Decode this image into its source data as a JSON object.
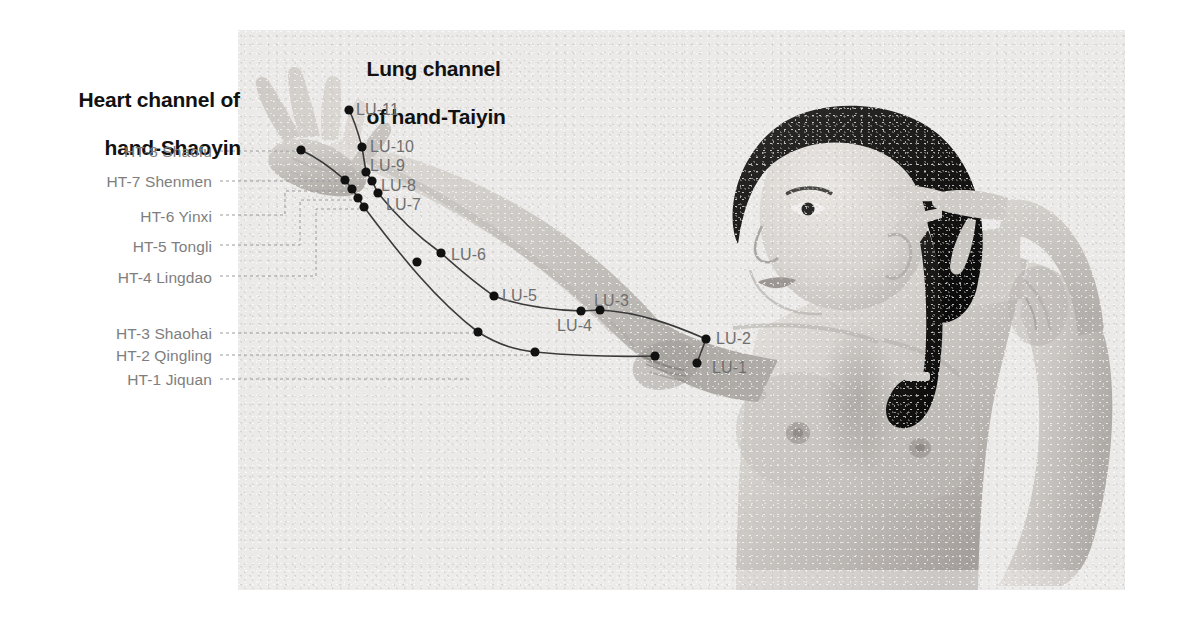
{
  "figure": {
    "kind": "anatomical-photo-diagram",
    "background_color": "#ffffff",
    "plate_color": "#eeeeee",
    "marker_color": "#111111",
    "channel_line_color": "#3a3a3a",
    "leader_line_color": "#9a9a9a",
    "heading_color": "#111111",
    "ht_label_color": "#7e7e7e",
    "lu_label_color": "#6f6f6f"
  },
  "headings": {
    "heart": {
      "line1": "Heart channel of",
      "line2": "hand-Shaoyin"
    },
    "lung": {
      "line1": "Lung channel",
      "line2": "of hand-Taiyin"
    }
  },
  "heart_channel": {
    "name": "Heart channel of hand-Shaoyin",
    "abbr": "HT",
    "points": [
      {
        "id": "HT-8",
        "label": "HT-8 Shaofu",
        "label_x": 212,
        "label_y": 143,
        "x": 301,
        "y": 150,
        "leader": "M 220 151 H 296"
      },
      {
        "id": "HT-7",
        "label": "HT-7 Shenmen",
        "label_x": 212,
        "label_y": 173,
        "x": 345,
        "y": 180,
        "leader": "M 220 181 H 340"
      },
      {
        "id": "HT-6",
        "label": "HT-6 Yinxi",
        "label_x": 212,
        "label_y": 208,
        "x": 352,
        "y": 189,
        "leader": "M 220 215 H 285 V 191 H 347"
      },
      {
        "id": "HT-5",
        "label": "HT-5 Tongli",
        "label_x": 212,
        "label_y": 238,
        "x": 358,
        "y": 198,
        "leader": "M 220 245 H 300 V 200 H 353"
      },
      {
        "id": "HT-4",
        "label": "HT-4 Lingdao",
        "label_x": 212,
        "label_y": 269,
        "x": 364,
        "y": 207,
        "leader": "M 220 276 H 316 V 209 H 359"
      },
      {
        "id": "HT-3",
        "label": "HT-3 Shaohai",
        "label_x": 212,
        "label_y": 325,
        "x": 478,
        "y": 332,
        "leader": "M 220 333 H 473"
      },
      {
        "id": "HT-2",
        "label": "HT-2 Qingling",
        "label_x": 212,
        "label_y": 347,
        "x": 535,
        "y": 352,
        "leader": "M 220 355 H 530"
      },
      {
        "id": "HT-1",
        "label": "HT-1 Jiquan",
        "label_x": 212,
        "label_y": 371,
        "x": 655,
        "y": 356,
        "leader": "M 220 379 H 470 V 379 H 470"
      }
    ],
    "path": "M 301 150 C 322 160 336 172 345 180 L 352 189 L 358 198 L 364 207 C 400 255 436 300 478 332 C 500 346 518 350 535 352 C 578 356 620 357 655 356"
  },
  "lung_channel": {
    "name": "Lung channel of hand-Taiyin",
    "abbr": "LU",
    "points": [
      {
        "id": "LU-11",
        "label": "LU-11",
        "label_x": 356,
        "label_y": 101,
        "x": 349,
        "y": 110
      },
      {
        "id": "LU-10",
        "label": "LU-10",
        "label_x": 370,
        "label_y": 138,
        "x": 362,
        "y": 147
      },
      {
        "id": "LU-9",
        "label": "LU-9",
        "label_x": 370,
        "label_y": 157,
        "x": 366,
        "y": 172
      },
      {
        "id": "LU-8",
        "label": "LU-8",
        "label_x": 381,
        "label_y": 177,
        "x": 372,
        "y": 181
      },
      {
        "id": "LU-7",
        "label": "LU-7",
        "label_x": 386,
        "label_y": 196,
        "x": 378,
        "y": 193
      },
      {
        "id": "LU-6",
        "label": "LU-6",
        "label_x": 451,
        "label_y": 246,
        "x": 441,
        "y": 253
      },
      {
        "id": "LU-5",
        "label": "LU-5",
        "label_x": 502,
        "label_y": 287,
        "x": 494,
        "y": 296
      },
      {
        "id": "LU-4",
        "label": "LU-4",
        "label_x": 557,
        "label_y": 317,
        "x": 581,
        "y": 311
      },
      {
        "id": "LU-3",
        "label": "LU-3",
        "label_x": 594,
        "label_y": 292,
        "x": 600,
        "y": 310
      },
      {
        "id": "LU-2",
        "label": "LU-2",
        "label_x": 716,
        "label_y": 330,
        "x": 706,
        "y": 339
      },
      {
        "id": "LU-1",
        "label": "LU-1",
        "label_x": 712,
        "label_y": 359,
        "x": 697,
        "y": 363
      }
    ],
    "path": "M 349 110 C 356 124 359 136 362 147 L 366 172 L 372 181 L 378 193 C 398 218 420 238 441 253 C 460 270 478 285 494 296 C 520 306 552 310 581 311 L 600 310 C 640 312 676 326 706 339",
    "branch_path": "M 706 339 L 697 363"
  },
  "markers": {
    "heart_extra": [
      {
        "x": 417,
        "y": 262
      }
    ]
  }
}
